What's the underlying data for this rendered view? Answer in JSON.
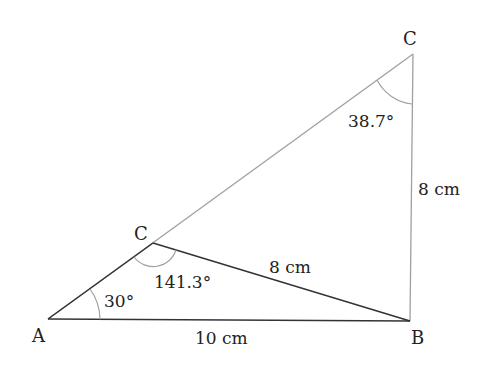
{
  "diagram": {
    "points": {
      "A": {
        "label": "A",
        "x": 48,
        "y": 319
      },
      "B": {
        "label": "B",
        "x": 410,
        "y": 321
      },
      "C1": {
        "label": "C",
        "x": 153,
        "y": 243
      },
      "C2": {
        "label": "C",
        "x": 413,
        "y": 54
      }
    },
    "sides": {
      "AB": "10 cm",
      "C1B": "8 cm",
      "C2B": "8 cm"
    },
    "angles": {
      "A": "30°",
      "C1": "141.3°",
      "C2": "38.7°"
    },
    "colors": {
      "dark_line": "#333333",
      "light_line": "#a0a0a0",
      "text": "#222222"
    }
  }
}
